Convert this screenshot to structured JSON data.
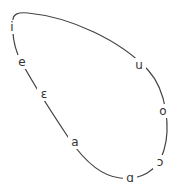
{
  "diagram": {
    "type": "vowel-ellipse",
    "line_color": "#444444",
    "text_color": "#333333",
    "vowels": [
      {
        "symbol": "i",
        "x": 12,
        "y": 27
      },
      {
        "symbol": "e",
        "x": 22,
        "y": 62
      },
      {
        "symbol": "ɛ",
        "x": 44,
        "y": 94
      },
      {
        "symbol": "a",
        "x": 75,
        "y": 142
      },
      {
        "symbol": "ɑ",
        "x": 130,
        "y": 178
      },
      {
        "symbol": "ɔ",
        "x": 160,
        "y": 162
      },
      {
        "symbol": "o",
        "x": 163,
        "y": 111
      },
      {
        "symbol": "u",
        "x": 139,
        "y": 65
      }
    ]
  }
}
